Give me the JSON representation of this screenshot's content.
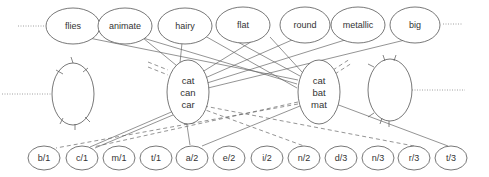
{
  "diagram": {
    "feature_nodes": [
      {
        "label": "flies",
        "cx": 73,
        "cy": 26
      },
      {
        "label": "animate",
        "cx": 125,
        "cy": 26
      },
      {
        "label": "hairy",
        "cx": 185,
        "cy": 26
      },
      {
        "label": "flat",
        "cx": 243,
        "cy": 25
      },
      {
        "label": "round",
        "cx": 305,
        "cy": 25
      },
      {
        "label": "metallic",
        "cx": 358,
        "cy": 25
      },
      {
        "label": "big",
        "cx": 415,
        "cy": 25
      }
    ],
    "hub_nodes": [
      {
        "name": "hub-left",
        "lines": [
          "cat",
          "can",
          "car"
        ],
        "cx": 188,
        "cy": 92
      },
      {
        "name": "hub-right",
        "lines": [
          "cat",
          "bat",
          "mat"
        ],
        "cx": 319,
        "cy": 92
      }
    ],
    "side_nodes": [
      {
        "name": "side-left",
        "cx": 73,
        "cy": 94
      },
      {
        "name": "side-right",
        "cx": 390,
        "cy": 90
      }
    ],
    "letter_nodes": [
      {
        "label": "b/1",
        "cx": 44,
        "cy": 158
      },
      {
        "label": "c/1",
        "cx": 82,
        "cy": 158
      },
      {
        "label": "m/1",
        "cx": 119,
        "cy": 158
      },
      {
        "label": "t/1",
        "cx": 156,
        "cy": 158
      },
      {
        "label": "a/2",
        "cx": 192,
        "cy": 158
      },
      {
        "label": "e/2",
        "cx": 229,
        "cy": 158
      },
      {
        "label": "i/2",
        "cx": 267,
        "cy": 158
      },
      {
        "label": "n/2",
        "cx": 304,
        "cy": 158
      },
      {
        "label": "d/3",
        "cx": 341,
        "cy": 158
      },
      {
        "label": "n/3",
        "cx": 378,
        "cy": 158
      },
      {
        "label": "r/3",
        "cx": 414,
        "cy": 158
      },
      {
        "label": "t/3",
        "cx": 451,
        "cy": 158
      }
    ]
  }
}
